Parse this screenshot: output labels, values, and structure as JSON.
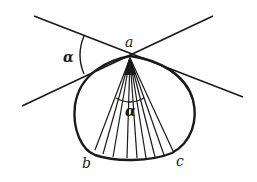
{
  "diagram": {
    "labels": {
      "vertex": "a",
      "left_angle": "α",
      "inner_angle": "α",
      "arc_start": "b",
      "arc_end": "c"
    },
    "colors": {
      "stroke": "#1a1a1a",
      "background": "#ffffff"
    },
    "ray_count": 9
  }
}
